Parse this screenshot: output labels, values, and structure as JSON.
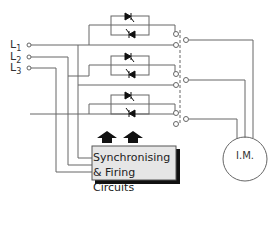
{
  "diagram": {
    "supply_lines": [
      {
        "id": "L1",
        "letter": "L",
        "sub": "1"
      },
      {
        "id": "L2",
        "letter": "L",
        "sub": "2"
      },
      {
        "id": "L3",
        "letter": "L",
        "sub": "3"
      }
    ],
    "control_box": {
      "line1": "Synchronising",
      "line2": "& Firing Circuits"
    },
    "motor": {
      "label": "I.M."
    },
    "colors": {
      "line": "#555555",
      "box_fill": "#e6e6e6",
      "box_shadow": "#111111",
      "arrow": "#111111"
    },
    "components": {
      "thyristor_pairs": 3,
      "bypass_switches": 3,
      "gate_arrows": 2
    }
  }
}
